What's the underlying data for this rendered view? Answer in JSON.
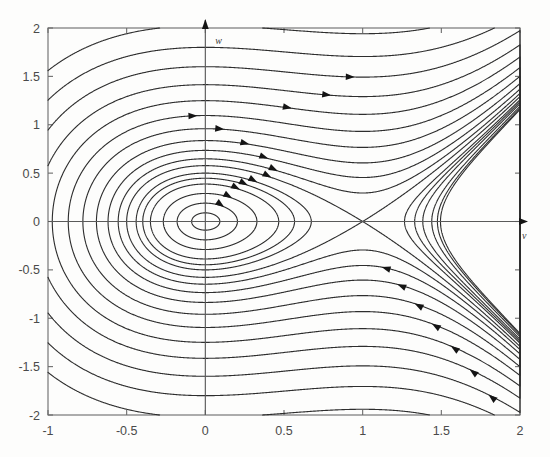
{
  "figure": {
    "title": "",
    "background_color": "#fdfdfc",
    "curve_color": "#2e2e2e",
    "axis_color": "#5a5a5a",
    "frame_color": "#6b6b6b"
  },
  "axes": {
    "x_axis_name": "v",
    "y_axis_name": "w",
    "x_ticks": [
      "-1",
      "-0.5",
      "0",
      "0.5",
      "1",
      "1.5",
      "2"
    ],
    "y_ticks": [
      "2",
      "1.5",
      "1",
      "0.5",
      "0",
      "-0.5",
      "-1",
      "-1.5",
      "-2"
    ]
  },
  "chart_data": {
    "type": "line",
    "title": "",
    "xlabel": "v",
    "ylabel": "w",
    "xlim": [
      -1,
      2
    ],
    "ylim": [
      -2,
      2
    ],
    "xticks": [
      -1,
      -0.5,
      0,
      0.5,
      1,
      1.5,
      2
    ],
    "yticks": [
      -2,
      -1.5,
      -1,
      -0.5,
      0,
      0.5,
      1,
      1.5,
      2
    ],
    "grid": false,
    "legend": "none",
    "equilibria": [
      {
        "name": "center",
        "v": 0,
        "w": 0,
        "type": "center"
      },
      {
        "name": "saddle",
        "v": 1,
        "w": 0,
        "type": "saddle"
      }
    ],
    "hamiltonian": "H = w^2/2 + v^2/2 - v^3/3",
    "saddle_level": 0.1666667,
    "level_values": [
      0.004,
      0.018,
      0.042,
      0.075,
      0.1,
      0.125,
      0.1666667,
      0.21,
      0.27,
      0.35,
      0.46,
      0.6,
      0.78,
      1.0,
      1.28,
      1.62,
      2.05
    ],
    "series": [
      {
        "name": "orbit-1",
        "level": 0.004
      },
      {
        "name": "orbit-2",
        "level": 0.018
      },
      {
        "name": "orbit-3",
        "level": 0.042
      },
      {
        "name": "orbit-4",
        "level": 0.075
      },
      {
        "name": "orbit-5",
        "level": 0.1
      },
      {
        "name": "orbit-6",
        "level": 0.125
      },
      {
        "name": "separatrix",
        "level": 0.1666667
      },
      {
        "name": "orbit-7",
        "level": 0.21
      },
      {
        "name": "orbit-8",
        "level": 0.27
      },
      {
        "name": "orbit-9",
        "level": 0.35
      },
      {
        "name": "orbit-10",
        "level": 0.46
      },
      {
        "name": "orbit-11",
        "level": 0.6
      },
      {
        "name": "orbit-12",
        "level": 0.78
      },
      {
        "name": "orbit-13",
        "level": 1.0
      },
      {
        "name": "orbit-14",
        "level": 1.28
      },
      {
        "name": "orbit-15",
        "level": 1.62
      },
      {
        "name": "orbit-16",
        "level": 2.05
      }
    ]
  }
}
